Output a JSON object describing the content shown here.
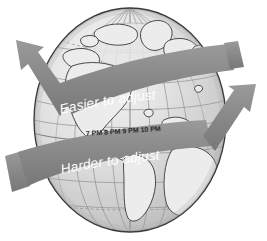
{
  "figure": {
    "background_color": "#ffffff",
    "globe": {
      "name": "earth-globe",
      "ocean_color": "#d9d9d9",
      "land_color": "#ededed",
      "graticule_color": "#8e8e8e",
      "outline_color": "#3a3a3a",
      "shadow_color": "#9a9a9a",
      "highlight_color": "#f2f2f2"
    },
    "arrows": [
      {
        "id": "easier-arrow",
        "label": "Easier to adjust",
        "color": "#8a8a8a",
        "direction": "west",
        "arrowhead": "upper-left"
      },
      {
        "id": "harder-arrow",
        "label": "Harder to adjust",
        "color": "#8a8a8a",
        "direction": "east",
        "arrowhead": "upper-right"
      }
    ],
    "timezone_labels": [
      {
        "hour": "7",
        "period": "PM"
      },
      {
        "hour": "8",
        "period": "PM"
      },
      {
        "hour": "9",
        "period": "PM"
      },
      {
        "hour": "10",
        "period": "PM"
      }
    ],
    "timezone_labels_text": "7 PM  8 PM  9 PM  10 PM"
  }
}
